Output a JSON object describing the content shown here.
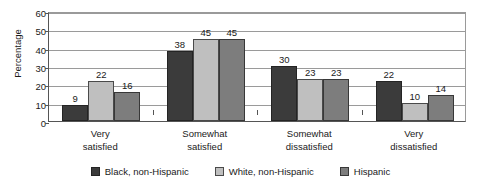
{
  "chart_data": {
    "type": "bar",
    "title": "",
    "subtitle": "",
    "xlabel": "",
    "ylabel": "Percentage",
    "ylim": [
      0,
      60
    ],
    "ytick_step": 10,
    "yticks": [
      60,
      50,
      40,
      30,
      20,
      10,
      0
    ],
    "grid": true,
    "legend_position": "bottom",
    "categories": [
      "Very\nsatisfied",
      "Somewhat\nsatisfied",
      "Somewhat\ndissatisfied",
      "Very\ndissatisfied"
    ],
    "category_lines": [
      [
        "Very",
        "satisfied"
      ],
      [
        "Somewhat",
        "satisfied"
      ],
      [
        "Somewhat",
        "dissatisfied"
      ],
      [
        "Very",
        "dissatisfied"
      ]
    ],
    "series": [
      {
        "name": "Black, non-Hispanic",
        "color": "#3b3b3b",
        "values": [
          9,
          38,
          30,
          22
        ]
      },
      {
        "name": "White, non-Hispanic",
        "color": "#bfbfbf",
        "values": [
          22,
          45,
          23,
          10
        ]
      },
      {
        "name": "Hispanic",
        "color": "#7d7d7d",
        "values": [
          16,
          45,
          23,
          14
        ]
      }
    ],
    "data_labels": [
      [
        "9",
        "22",
        "16"
      ],
      [
        "38",
        "45",
        "45"
      ],
      [
        "30",
        "23",
        "23"
      ],
      [
        "22",
        "10",
        "14"
      ]
    ]
  },
  "axis": {
    "y_title": "Percentage",
    "y_tick_labels": [
      "60",
      "50",
      "40",
      "30",
      "20",
      "10",
      "0"
    ]
  },
  "legend": {
    "items": [
      {
        "label": "Black, non-Hispanic",
        "swatch": "legend-swatch-black-non-hispanic"
      },
      {
        "label": "White, non-Hispanic",
        "swatch": "legend-swatch-white-non-hispanic"
      },
      {
        "label": "Hispanic",
        "swatch": "legend-swatch-hispanic"
      }
    ]
  }
}
